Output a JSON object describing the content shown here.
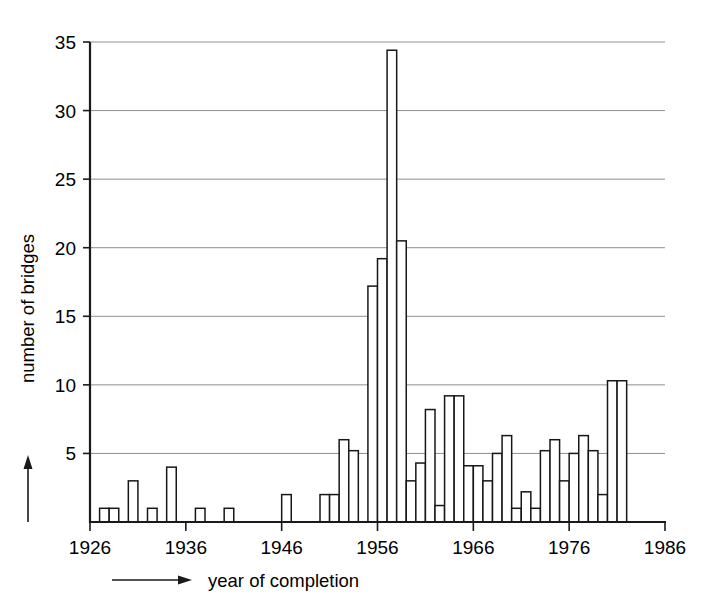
{
  "chart_data": {
    "type": "bar",
    "title": "",
    "subtitle": "",
    "xlabel": "year of completion",
    "ylabel": "number of bridges",
    "xlim": [
      1926,
      1986
    ],
    "ylim": [
      0,
      35
    ],
    "xticks": [
      1926,
      1936,
      1946,
      1956,
      1966,
      1976,
      1986
    ],
    "xtick_labels": [
      "1926",
      "1936",
      "1946",
      "1956",
      "1966",
      "1976",
      "1986"
    ],
    "yticks": [
      5,
      10,
      15,
      20,
      25,
      30,
      35
    ],
    "ytick_labels": [
      "5",
      "10",
      "15",
      "20",
      "25",
      "30",
      "35"
    ],
    "grid": "horizontal",
    "legend": "none",
    "bar_style": "hollow-outline",
    "bin_width_years": 1,
    "categories": [
      1926,
      1927,
      1928,
      1929,
      1930,
      1931,
      1932,
      1933,
      1934,
      1935,
      1936,
      1937,
      1938,
      1939,
      1940,
      1941,
      1942,
      1943,
      1944,
      1945,
      1946,
      1947,
      1948,
      1949,
      1950,
      1951,
      1952,
      1953,
      1954,
      1955,
      1956,
      1957,
      1958,
      1959,
      1960,
      1961,
      1962,
      1963,
      1964,
      1965,
      1966,
      1967,
      1968,
      1969,
      1970,
      1971,
      1972,
      1973,
      1974,
      1975,
      1976,
      1977,
      1978,
      1979,
      1980,
      1981,
      1982,
      1983,
      1984,
      1985
    ],
    "values": [
      0,
      1,
      1,
      0,
      3,
      0,
      1,
      0,
      4,
      0,
      0,
      1,
      0,
      0,
      1,
      0,
      0,
      0,
      0,
      0,
      2,
      0,
      0,
      0,
      2,
      2,
      6,
      5.2,
      0,
      17.2,
      19.2,
      34.4,
      20.5,
      3,
      4.3,
      8.2,
      1.2,
      9.2,
      9.2,
      4.1,
      4.1,
      3,
      5,
      6.3,
      1,
      2.2,
      1,
      5.2,
      6,
      3,
      5,
      6.3,
      5.2,
      2,
      10.3,
      10.3,
      0,
      0,
      0,
      0
    ],
    "peak": {
      "year": 1957,
      "value": 34.4
    },
    "axis_arrows": {
      "x": "right",
      "y": "up"
    }
  }
}
